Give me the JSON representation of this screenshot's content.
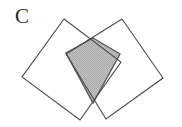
{
  "figure": {
    "label": "C",
    "caption_letter": "C",
    "background_color": "#ffffff",
    "stroke_color": "#4a4a4a",
    "stroke_width": 1.1,
    "shade_fill": "#b9b9b9",
    "shade_pattern": "checkerboard-dither",
    "shapes": [
      {
        "name": "left-square",
        "type": "square",
        "fill": "none",
        "points": "64,19 121,62 80,120 22,77"
      },
      {
        "name": "right-square",
        "type": "square",
        "fill": "none",
        "points": "122,19 163,78 106,119 66,54"
      },
      {
        "name": "intersection-kite",
        "type": "kite",
        "fill": "#b9b9b9",
        "points": "93,38 120,54 93,103 66,53"
      }
    ]
  }
}
